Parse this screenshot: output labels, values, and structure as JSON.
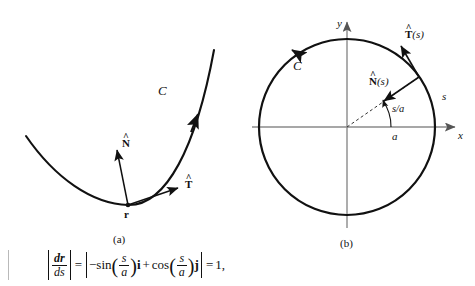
{
  "figure": {
    "caption_a": "(a)",
    "caption_b": "(b)",
    "panel_a": {
      "curve_label": "C",
      "point_label": "r",
      "normal_label": "N",
      "normal_hat": "^",
      "tangent_label": "T",
      "tangent_hat": "^"
    },
    "panel_b": {
      "curve_label": "C",
      "axis_x": "x",
      "axis_y": "y",
      "radius_label": "a",
      "arclength_label": "s",
      "angle_label": "s/a",
      "normal_label": "N",
      "normal_arg": "(s)",
      "normal_hat": "^",
      "tangent_label": "T",
      "tangent_arg": "(s)",
      "tangent_hat": "^"
    }
  },
  "equation": {
    "lhs_num": "dr",
    "lhs_den": "ds",
    "equals_1": "=",
    "minus": "−",
    "sin": "sin",
    "sin_num": "s",
    "sin_den": "a",
    "i_vector": "i",
    "plus": "+",
    "cos": "cos",
    "cos_num": "s",
    "cos_den": "a",
    "j_vector": "j",
    "equals_2": "=",
    "rhs": "1,"
  },
  "colors": {
    "ink": "#111111",
    "axis": "#808080",
    "background": "#ffffff"
  }
}
